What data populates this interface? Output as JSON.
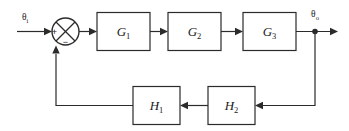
{
  "diagram": {
    "type": "control-system-block-diagram",
    "background_color": "#ffffff",
    "line_color": "#2b2b2b",
    "signals": {
      "input": {
        "base": "θ",
        "subscript": "i",
        "full": "θi"
      },
      "output": {
        "base": "θ",
        "subscript": "o",
        "full": "θo"
      }
    },
    "summing_junction": {
      "name": "summing-junction",
      "input_sign": "+",
      "feedback_sign": "−"
    },
    "forward_blocks": [
      {
        "base": "G",
        "subscript": "1",
        "full": "G1"
      },
      {
        "base": "G",
        "subscript": "2",
        "full": "G2"
      },
      {
        "base": "G",
        "subscript": "3",
        "full": "G3"
      }
    ],
    "feedback_blocks": [
      {
        "base": "H",
        "subscript": "1",
        "full": "H1"
      },
      {
        "base": "H",
        "subscript": "2",
        "full": "H2"
      }
    ]
  }
}
